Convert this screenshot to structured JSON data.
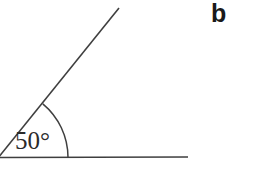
{
  "figure": {
    "part_label": "b",
    "angle_label": "50°",
    "angle_degrees": 50,
    "background_color": "#ffffff",
    "stroke_color": "#3f3f3f",
    "text_color": "#2b2b2b",
    "part_label_color": "#1a1a1a",
    "elements": {
      "vertex": "angle-vertex",
      "horizontal_ray": "horizontal-ray",
      "diagonal_ray": "diagonal-ray",
      "arc": "angle-arc"
    },
    "geometry": {
      "vertex_x": -2,
      "vertex_y": 158,
      "horizontal_end_x": 188,
      "horizontal_end_y": 157,
      "diagonal_end_x": 119,
      "diagonal_end_y": 8,
      "arc_radius": 70,
      "arc_start_x": 68,
      "arc_start_y": 157,
      "arc_end_x": 42,
      "arc_end_y": 105,
      "stroke_width": 1.6
    }
  }
}
